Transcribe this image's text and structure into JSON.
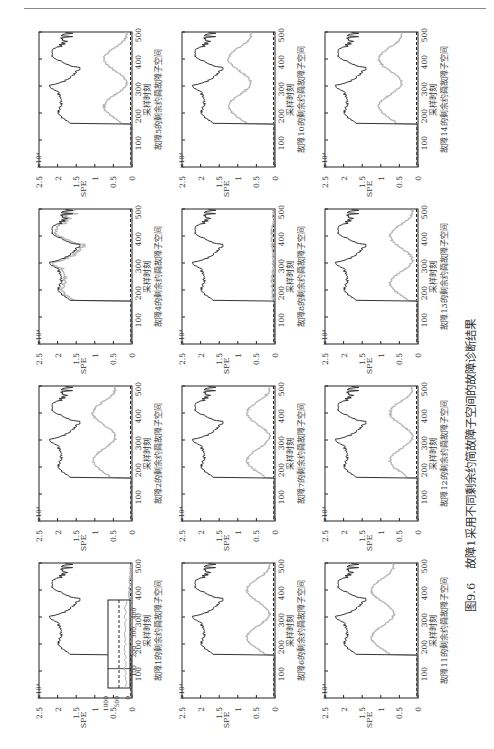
{
  "figure": {
    "caption_number": "图9.6",
    "caption_text": "故障1采用不同剩余约简故障子空间的故障诊断结果",
    "colors": {
      "fault_curve": "#333333",
      "reduced_curve": "#b5b5b5",
      "axis": "#222222",
      "threshold": "#222222"
    }
  },
  "chart_data": {
    "type": "line",
    "layout": "grid of 12 subplots, page rotated 90 degrees",
    "shared": {
      "xlabel": "采样时刻",
      "ylabel": "SPE",
      "y_multiplier": "×10⁴",
      "xlim": [
        0,
        500
      ],
      "ylim": [
        0,
        2.5
      ],
      "xticks": [
        100,
        200,
        300,
        400,
        500
      ],
      "yticks": [
        "0",
        "0.5",
        "1",
        "1.5",
        "2",
        "2.5"
      ],
      "fault_onset": 160
    },
    "panels": [
      {
        "title": "故障1的剩余约简故障子空间",
        "col": 0,
        "row": 3,
        "reduced_level": "low",
        "inset": {
          "ylim": [
            0,
            1000
          ],
          "yticks": [
            "0",
            "500",
            "1000"
          ],
          "xticks": [
            "100",
            "200",
            "300",
            "400"
          ]
        }
      },
      {
        "title": "故障2的剩余约简故障子空间",
        "col": 0,
        "row": 2,
        "reduced_level": "mid-high"
      },
      {
        "title": "故障4的剩余约简故障子空间",
        "col": 0,
        "row": 1,
        "reduced_level": "overlap"
      },
      {
        "title": "故障5的剩余约简故障子空间",
        "col": 0,
        "row": 0,
        "reduced_level": "mid"
      },
      {
        "title": "故障6的剩余约简故障子空间",
        "col": 1,
        "row": 3,
        "reduced_level": "mid"
      },
      {
        "title": "故障7的剩余约简故障子空间",
        "col": 1,
        "row": 2,
        "reduced_level": "mid"
      },
      {
        "title": "故障8的剩余约简故障子空间",
        "col": 1,
        "row": 1,
        "reduced_level": "near-zero"
      },
      {
        "title": "故障10的剩余约简故障子空间",
        "col": 1,
        "row": 0,
        "reduced_level": "high"
      },
      {
        "title": "故障11的剩余约简故障子空间",
        "col": 2,
        "row": 3,
        "reduced_level": "high"
      },
      {
        "title": "故障12的剩余约简故障子空间",
        "col": 2,
        "row": 2,
        "reduced_level": "mid"
      },
      {
        "title": "故障13的剩余约简故障子空间",
        "col": 2,
        "row": 1,
        "reduced_level": "mid"
      },
      {
        "title": "故障14的剩余约简故障子空间",
        "col": 2,
        "row": 0,
        "reduced_level": "mid-high"
      }
    ]
  }
}
